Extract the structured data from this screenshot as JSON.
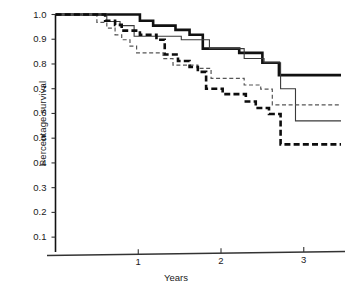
{
  "chart_data": {
    "type": "line",
    "subtype": "kaplan-meier-step",
    "title": "",
    "xlabel": "Years",
    "ylabel": "Percentage survival",
    "xlim": [
      0,
      3.45
    ],
    "ylim": [
      0.05,
      1.0
    ],
    "xticks": [
      1,
      2,
      3
    ],
    "xtick_labels": [
      "1",
      "2",
      "3"
    ],
    "yticks": [
      0.1,
      0.2,
      0.3,
      0.4,
      0.5,
      0.6,
      0.7,
      0.8,
      0.9,
      1.0
    ],
    "ytick_labels": [
      "0.1",
      "0.2",
      "0.3",
      "0.4",
      "0.5",
      "0.6",
      "0.7",
      "0.8",
      "0.9",
      "1.0"
    ],
    "grid": false,
    "legend": "none",
    "series": [
      {
        "name": "thick-solid",
        "style": "solid",
        "width": 2.6,
        "color": "#111111",
        "final_value": 0.755,
        "points": [
          [
            0.0,
            1.0
          ],
          [
            1.02,
            1.0
          ],
          [
            1.02,
            0.975
          ],
          [
            1.18,
            0.975
          ],
          [
            1.18,
            0.955
          ],
          [
            1.45,
            0.955
          ],
          [
            1.45,
            0.938
          ],
          [
            1.62,
            0.938
          ],
          [
            1.62,
            0.918
          ],
          [
            1.78,
            0.918
          ],
          [
            1.78,
            0.862
          ],
          [
            2.22,
            0.862
          ],
          [
            2.22,
            0.845
          ],
          [
            2.5,
            0.845
          ],
          [
            2.5,
            0.805
          ],
          [
            2.7,
            0.805
          ],
          [
            2.7,
            0.755
          ],
          [
            3.45,
            0.755
          ]
        ]
      },
      {
        "name": "thin-solid",
        "style": "solid",
        "width": 1.1,
        "color": "#3a3a3a",
        "final_value": 0.57,
        "points": [
          [
            0.0,
            1.0
          ],
          [
            0.62,
            1.0
          ],
          [
            0.62,
            0.972
          ],
          [
            0.78,
            0.972
          ],
          [
            0.78,
            0.955
          ],
          [
            0.95,
            0.955
          ],
          [
            0.95,
            0.912
          ],
          [
            1.52,
            0.912
          ],
          [
            1.52,
            0.898
          ],
          [
            1.86,
            0.898
          ],
          [
            1.86,
            0.862
          ],
          [
            2.28,
            0.862
          ],
          [
            2.28,
            0.822
          ],
          [
            2.52,
            0.822
          ],
          [
            2.52,
            0.805
          ],
          [
            2.72,
            0.805
          ],
          [
            2.72,
            0.7
          ],
          [
            2.9,
            0.7
          ],
          [
            2.9,
            0.57
          ],
          [
            3.45,
            0.57
          ]
        ]
      },
      {
        "name": "thin-dashed",
        "style": "dashed",
        "width": 1.2,
        "color": "#555555",
        "final_value": 0.635,
        "points": [
          [
            0.0,
            1.0
          ],
          [
            0.5,
            1.0
          ],
          [
            0.5,
            0.968
          ],
          [
            0.62,
            0.968
          ],
          [
            0.62,
            0.945
          ],
          [
            0.72,
            0.945
          ],
          [
            0.72,
            0.918
          ],
          [
            0.8,
            0.918
          ],
          [
            0.8,
            0.898
          ],
          [
            0.9,
            0.898
          ],
          [
            0.9,
            0.872
          ],
          [
            0.98,
            0.872
          ],
          [
            0.98,
            0.845
          ],
          [
            1.3,
            0.845
          ],
          [
            1.3,
            0.822
          ],
          [
            1.42,
            0.822
          ],
          [
            1.42,
            0.795
          ],
          [
            1.72,
            0.795
          ],
          [
            1.72,
            0.782
          ],
          [
            1.88,
            0.782
          ],
          [
            1.88,
            0.742
          ],
          [
            2.28,
            0.742
          ],
          [
            2.28,
            0.715
          ],
          [
            2.48,
            0.715
          ],
          [
            2.48,
            0.698
          ],
          [
            2.62,
            0.698
          ],
          [
            2.62,
            0.635
          ],
          [
            3.45,
            0.635
          ]
        ]
      },
      {
        "name": "thick-dashed",
        "style": "dashed",
        "width": 2.6,
        "color": "#0d0d0d",
        "final_value": 0.475,
        "points": [
          [
            0.0,
            1.0
          ],
          [
            0.6,
            1.0
          ],
          [
            0.6,
            0.975
          ],
          [
            0.72,
            0.975
          ],
          [
            0.72,
            0.958
          ],
          [
            0.8,
            0.958
          ],
          [
            0.8,
            0.935
          ],
          [
            1.02,
            0.935
          ],
          [
            1.02,
            0.918
          ],
          [
            1.22,
            0.918
          ],
          [
            1.22,
            0.898
          ],
          [
            1.32,
            0.898
          ],
          [
            1.32,
            0.838
          ],
          [
            1.48,
            0.838
          ],
          [
            1.48,
            0.812
          ],
          [
            1.62,
            0.812
          ],
          [
            1.62,
            0.788
          ],
          [
            1.72,
            0.788
          ],
          [
            1.72,
            0.768
          ],
          [
            1.82,
            0.768
          ],
          [
            1.82,
            0.7
          ],
          [
            2.02,
            0.7
          ],
          [
            2.02,
            0.678
          ],
          [
            2.3,
            0.678
          ],
          [
            2.3,
            0.648
          ],
          [
            2.42,
            0.648
          ],
          [
            2.42,
            0.622
          ],
          [
            2.58,
            0.622
          ],
          [
            2.58,
            0.598
          ],
          [
            2.72,
            0.598
          ],
          [
            2.72,
            0.475
          ],
          [
            3.45,
            0.475
          ]
        ]
      }
    ]
  },
  "axes": {
    "x_axis_label": "Years",
    "y_axis_label": "Percentage survival"
  }
}
